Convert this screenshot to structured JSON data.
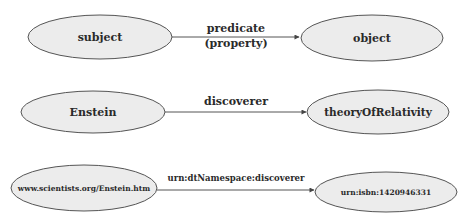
{
  "diagram": {
    "rows": [
      {
        "subject": "subject",
        "predicate_line1": "predicate",
        "predicate_line2": "(property)",
        "object": "object"
      },
      {
        "subject": "Enstein",
        "predicate_line1": "discoverer",
        "object": "theoryOfRelativity"
      },
      {
        "subject": "www.scientists.org/Enstein.htm",
        "predicate_line1": "urn:dtNamespace:discoverer",
        "object": "urn:isbn:1420946331"
      }
    ],
    "colors": {
      "node_fill": "#ececec",
      "node_stroke": "#555555",
      "text": "#2a2a2a"
    }
  }
}
